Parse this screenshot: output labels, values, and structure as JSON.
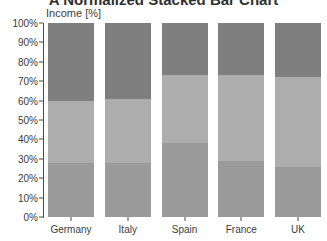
{
  "chart_data": {
    "type": "bar",
    "variant": "normalized-stacked",
    "title": "A Normalized Stacked Bar Chart",
    "xlabel": "",
    "ylabel": "Income [%]",
    "ylim": [
      0,
      100
    ],
    "grid": false,
    "legend": "none",
    "categories": [
      "Germany",
      "Italy",
      "Spain",
      "France",
      "UK"
    ],
    "ytick_labels": [
      "0%",
      "10%",
      "20%",
      "30%",
      "40%",
      "50%",
      "60%",
      "70%",
      "80%",
      "90%",
      "100%"
    ],
    "ytick_values": [
      0,
      10,
      20,
      30,
      40,
      50,
      60,
      70,
      80,
      90,
      100
    ],
    "series": [
      {
        "name": "Series 1",
        "color": "#9a9a9a",
        "values": [
          28,
          28,
          38,
          29,
          26
        ]
      },
      {
        "name": "Series 2",
        "color": "#adadad",
        "values": [
          32,
          33,
          35,
          44,
          46
        ]
      },
      {
        "name": "Series 3",
        "color": "#7f7f7f",
        "values": [
          40,
          39,
          27,
          27,
          28
        ]
      }
    ]
  },
  "colors": {
    "series_1": "#9a9a9a",
    "series_2": "#adadad",
    "series_3": "#7f7f7f",
    "axis": "#4a4a4a",
    "text": "#3c3c3c",
    "background": "#ffffff"
  }
}
